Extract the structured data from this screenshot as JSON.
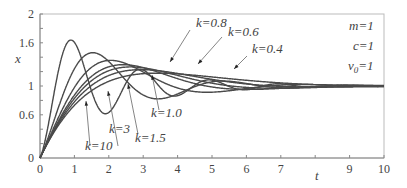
{
  "chart_data": {
    "type": "line",
    "title": "",
    "xlabel": "t",
    "ylabel": "x",
    "xlim": [
      0,
      10
    ],
    "ylim": [
      0,
      2
    ],
    "x_ticks": [
      "0",
      "1",
      "2",
      "3",
      "4",
      "5",
      "6",
      "7",
      "",
      "9",
      "10"
    ],
    "y_ticks": [
      "0",
      "0.6",
      "1",
      "1.6",
      "2"
    ],
    "grid": false,
    "params": [
      "m=1",
      "c=1",
      "v0=1"
    ],
    "series": [
      {
        "name": "k=0.4",
        "label": "k=0.4"
      },
      {
        "name": "k=0.6",
        "label": "k=0.6"
      },
      {
        "name": "k=0.8",
        "label": "k=0.8"
      },
      {
        "name": "k=1.0",
        "label": "k=1.0"
      },
      {
        "name": "k=1.5",
        "label": "k=1.5"
      },
      {
        "name": "k=3",
        "label": "k=3"
      },
      {
        "name": "k=10",
        "label": "k=10"
      }
    ]
  },
  "labels": {
    "xlabel": "t",
    "ylabel": "x",
    "m": "m=1",
    "c": "c=1",
    "v0_prefix": "v",
    "v0_sub": "0",
    "v0_suffix": "=1",
    "k08": "k=0.8",
    "k06": "k=0.6",
    "k04": "k=0.4",
    "k10": "k=1.0",
    "k15": "k=1.5",
    "k3": "k=3",
    "k10b": "k=10"
  },
  "colors": {
    "curve": "#4a4a4a",
    "axis": "#888888",
    "text": "#444444"
  }
}
